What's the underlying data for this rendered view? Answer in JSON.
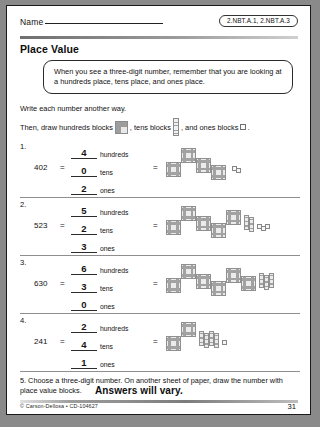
{
  "header": {
    "name_label": "Name",
    "standards_badge": "2.NBT.A.1, 2.NBT.A.3"
  },
  "title": "Place Value",
  "callout": {
    "text": "When you see a three-digit number, remember that you are looking at a hundreds place, tens place, and ones place."
  },
  "directions": {
    "line1": "Write each number another way.",
    "line2_a": "Then, draw hundreds blocks",
    "line2_b": ", tens blocks",
    "line2_c": ", and ones blocks",
    "line2_d": "."
  },
  "units": {
    "hundreds": "hundreds",
    "tens": "tens",
    "ones": "ones"
  },
  "equals": "=",
  "problems": [
    {
      "number": "1.",
      "value": "402",
      "hundreds": "4",
      "tens": "0",
      "ones": "2",
      "blocks": {
        "hundreds": 4,
        "tens": 0,
        "ones": 2
      }
    },
    {
      "number": "2.",
      "value": "523",
      "hundreds": "5",
      "tens": "2",
      "ones": "3",
      "blocks": {
        "hundreds": 5,
        "tens": 2,
        "ones": 3
      }
    },
    {
      "number": "3.",
      "value": "630",
      "hundreds": "6",
      "tens": "3",
      "ones": "0",
      "blocks": {
        "hundreds": 6,
        "tens": 3,
        "ones": 0
      }
    },
    {
      "number": "4.",
      "value": "241",
      "hundreds": "2",
      "tens": "4",
      "ones": "1",
      "blocks": {
        "hundreds": 2,
        "tens": 4,
        "ones": 1
      }
    }
  ],
  "item5": {
    "text": "5. Choose a three-digit number. On another sheet of paper, draw the number with place value blocks.",
    "answer_note": "Answers will vary."
  },
  "footer": {
    "copyright": "© Carson-Dellosa • CD-104627",
    "page_number": "31"
  }
}
